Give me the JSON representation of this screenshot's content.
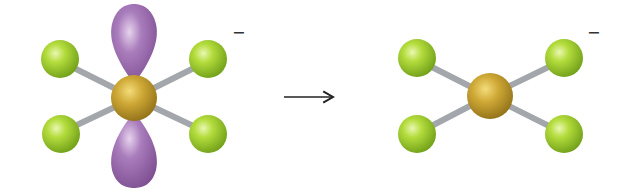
{
  "diagram": {
    "title": "",
    "reactant": {
      "label": "square planar anion with lone pair orbitals",
      "charge": "−",
      "central_atom_color": "#c9a434",
      "ligand_color": "#9ccc2e",
      "lobe_color": "#9a68ad",
      "bond_color": "#a9adb2"
    },
    "arrow": {
      "direction": "right"
    },
    "product": {
      "label": "square planar anion",
      "charge": "−",
      "central_atom_color": "#c9a434",
      "ligand_color": "#9ccc2e",
      "bond_color": "#a9adb2"
    }
  }
}
